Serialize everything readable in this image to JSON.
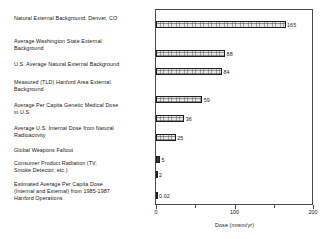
{
  "chart_data": {
    "type": "bar",
    "orientation": "horizontal",
    "title": "",
    "xlabel": "Dose (mrem/yr)",
    "ylabel": "",
    "xlim": [
      0,
      200
    ],
    "grid": false,
    "legend": null,
    "xticks": [
      0,
      50,
      100,
      150,
      200
    ],
    "xtick_labels": [
      "0",
      "",
      "100",
      "",
      "200"
    ],
    "categories": [
      "Natural External Background, Denver, CO",
      "Average Washington State External\nBackground",
      "U.S. Average Natural External Background",
      "Measured (TLD) Hanford Area External\nBackground",
      "Average Per Capita Genetic Medical Dose\nin U.S.",
      "Average U.S. Internal Dose from Natural\nRadioactivity",
      "Global Weapons Fallout",
      "Consumer Product Radiation (TV,\nSmoke Detector, etc.)",
      "Estimated Average Per Capita Dose\n(Internal and External) from 1985-1987\nHanford Operations"
    ],
    "values": [
      165,
      88,
      84,
      59,
      36,
      25,
      5,
      2,
      0.02
    ],
    "value_labels": [
      "165",
      "88",
      "84",
      "59",
      "36",
      "25",
      "5",
      "2",
      "0.02"
    ]
  },
  "axis": {
    "x_title": "Dose (mrem/yr)",
    "ticks": [
      {
        "value": 0,
        "label": "0",
        "major": true
      },
      {
        "value": 50,
        "label": "",
        "major": false
      },
      {
        "value": 100,
        "label": "100",
        "major": true
      },
      {
        "value": 150,
        "label": "",
        "major": false
      },
      {
        "value": 200,
        "label": "200",
        "major": true
      }
    ]
  },
  "colors": {
    "bar_fill": "#e8e8e8",
    "bar_border": "#1e1e1e",
    "frame": "#4a4a4a",
    "text": "#1a1a1a",
    "background": "#ffffff"
  }
}
